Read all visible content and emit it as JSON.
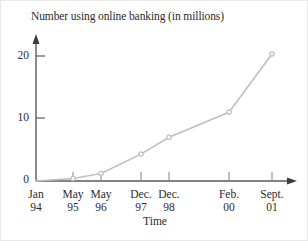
{
  "chart_data": {
    "type": "line",
    "title": "Number using online banking (in millions)",
    "xlabel": "Time",
    "ylabel": "",
    "categories": [
      "Jan 94",
      "May 95",
      "May 96",
      "Dec. 97",
      "Dec. 98",
      "Feb. 00",
      "Sept. 01"
    ],
    "category_lines": [
      {
        "line1": "Jan",
        "line2": "94"
      },
      {
        "line1": "May",
        "line2": "95"
      },
      {
        "line1": "May",
        "line2": "96"
      },
      {
        "line1": "Dec.",
        "line2": "97"
      },
      {
        "line1": "Dec.",
        "line2": "98"
      },
      {
        "line1": "Feb.",
        "line2": "00"
      },
      {
        "line1": "Sept.",
        "line2": "01"
      }
    ],
    "values": [
      0,
      0.4,
      1.2,
      4.3,
      7,
      11,
      20.3
    ],
    "ytick_labels": [
      "0",
      "10",
      "20"
    ],
    "ytick_values": [
      0,
      10,
      20
    ],
    "ylim": [
      0,
      23
    ],
    "grid": false,
    "legend": "none",
    "marker": "circle-open",
    "line_color": "#bfbfbf",
    "marker_color": "#bfbfbf",
    "axis_color": "#595959",
    "text_color": "#2b2b2b"
  }
}
